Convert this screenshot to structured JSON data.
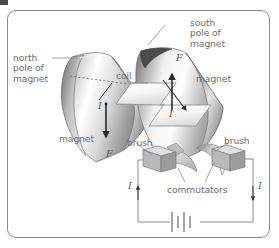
{
  "figure": {
    "type": "physics-diagram",
    "frame": {
      "border_color": "#8b8b8b",
      "background": "#ffffff",
      "radius_px": 9
    }
  },
  "labels": {
    "north_pole": "north\npole of\nmagnet",
    "south_pole": "south\npole of\nmagnet",
    "coil": "coil",
    "magnet_right": "magnet",
    "magnet_left": "magnet",
    "brush_left": "brush",
    "brush_right": "brush",
    "commutators": "commutators"
  },
  "symbols": {
    "force_left": "F",
    "force_right": "F",
    "current_coil_left": "I",
    "current_coil_right": "I",
    "current_wire_left": "I",
    "current_wire_right": "I"
  },
  "components": [
    {
      "name": "north-pole-magnet",
      "kind": "curved-pole-piece",
      "side": "left",
      "shading": "gradient-grey"
    },
    {
      "name": "south-pole-magnet",
      "kind": "curved-pole-piece",
      "side": "right",
      "shading": "gradient-grey"
    },
    {
      "name": "coil",
      "kind": "z-shaped-loop",
      "fill": "#f2f2f2"
    },
    {
      "name": "commutator",
      "kind": "split-ring",
      "fill": "#d6d6d6"
    },
    {
      "name": "brush-left",
      "kind": "cuboid-contact",
      "fill": "#c9c9c9"
    },
    {
      "name": "brush-right",
      "kind": "cuboid-contact",
      "fill": "#c9c9c9"
    },
    {
      "name": "battery",
      "kind": "cell-symbol",
      "plates": 4
    },
    {
      "name": "circuit-wire",
      "kind": "conductor-loop",
      "stroke": "#8a8a8a"
    }
  ],
  "colors": {
    "label_text": "#6d6d6d",
    "symbol_text": "#5a5a5a",
    "line": "#8a8a8a",
    "magnet_dark": "#6f6f6f",
    "magnet_light": "#fbfbfb",
    "arrow": "#2b2b2b",
    "frame": "#8b8b8b"
  }
}
